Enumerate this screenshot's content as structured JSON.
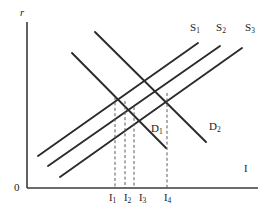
{
  "figure": {
    "background_color": "#ffffff",
    "line_color": "#2b2b2b",
    "axis_color": "#3a3a3a",
    "dash_color": "#5a5a5a"
  },
  "axes": {
    "y_label": "r",
    "x_label": "I",
    "origin_label": "0",
    "y_axis": {
      "x": 27,
      "y_top": 22,
      "y_bottom": 188
    },
    "x_axis": {
      "y": 188,
      "x_left": 27,
      "x_right": 258
    }
  },
  "curve_labels": {
    "supply": [
      {
        "text": "S",
        "sub": "1",
        "x": 190,
        "y": 22
      },
      {
        "text": "S",
        "sub": "2",
        "x": 216,
        "y": 22
      },
      {
        "text": "S",
        "sub": "3",
        "x": 245,
        "y": 22
      }
    ],
    "demand": [
      {
        "text": "D",
        "sub": "1",
        "x": 151,
        "y": 123
      },
      {
        "text": "D",
        "sub": "2",
        "x": 209,
        "y": 121
      }
    ]
  },
  "tick_labels": [
    {
      "text": "I",
      "sub": "1",
      "x": 109,
      "y": 193
    },
    {
      "text": "I",
      "sub": "2",
      "x": 124,
      "y": 193
    },
    {
      "text": "I",
      "sub": "3",
      "x": 139,
      "y": 193
    },
    {
      "text": "I",
      "sub": "4",
      "x": 164,
      "y": 193
    }
  ],
  "chart_data": {
    "type": "line",
    "xlabel": "I",
    "ylabel": "r",
    "grid": false,
    "legend": "inline-curve-labels",
    "xlim": [
      0,
      269
    ],
    "ylim": [
      0,
      215
    ],
    "note": "Investment (I) on horizontal axis, interest rate (r) on vertical axis. Three parallel upward-sloping supply curves S1, S2, S3 shift rightward; two parallel downward-sloping demand curves D1, D2 shift rightward. Dashed verticals drop from the four labelled intersections to the horizontal axis at I1, I2, I3, I4.",
    "series": [
      {
        "name": "S1",
        "kind": "supply",
        "style": "solid",
        "points": [
          [
            38,
            156
          ],
          [
            198,
            43
          ]
        ]
      },
      {
        "name": "S2",
        "kind": "supply",
        "style": "solid",
        "points": [
          [
            48,
            166
          ],
          [
            220,
            46
          ]
        ]
      },
      {
        "name": "S3",
        "kind": "supply",
        "style": "solid",
        "points": [
          [
            60,
            177
          ],
          [
            242,
            48
          ]
        ]
      },
      {
        "name": "D1",
        "kind": "demand",
        "style": "solid",
        "points": [
          [
            72,
            53
          ],
          [
            166,
            148
          ]
        ]
      },
      {
        "name": "D2",
        "kind": "demand",
        "style": "solid",
        "points": [
          [
            95,
            32
          ],
          [
            206,
            142
          ]
        ]
      }
    ],
    "dropline_x_values": [
      115,
      125,
      134,
      167
    ],
    "droplines": [
      {
        "label": "I1",
        "x": 115,
        "y_top": 97,
        "y_bottom": 188
      },
      {
        "label": "I2",
        "x": 125,
        "y_top": 101,
        "y_bottom": 188
      },
      {
        "label": "I3",
        "x": 134,
        "y_top": 107,
        "y_bottom": 188
      },
      {
        "label": "I4",
        "x": 167,
        "y_top": 93,
        "y_bottom": 188
      }
    ],
    "equilibria": [
      {
        "name": "I1",
        "intersection_of": [
          "S1",
          "D1"
        ],
        "x": 115
      },
      {
        "name": "I2",
        "intersection_of": [
          "S2",
          "D1"
        ],
        "x": 125
      },
      {
        "name": "I3",
        "intersection_of": [
          "S3",
          "D1"
        ],
        "x": 134
      },
      {
        "name": "I4",
        "intersection_of": [
          "S3",
          "D2"
        ],
        "x": 167
      }
    ]
  }
}
